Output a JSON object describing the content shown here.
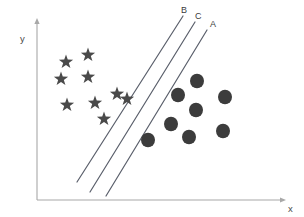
{
  "figure": {
    "title": "",
    "background_color": "#ffffff"
  },
  "axes": {
    "x_label": "x",
    "y_label": "y",
    "axis_color": "#a8a8a8",
    "origin": {
      "x": 37,
      "y": 200
    },
    "x_axis_end": {
      "x": 282,
      "y": 200
    },
    "y_axis_top": {
      "x": 37,
      "y": 22
    },
    "x_label_pos": {
      "x": 288,
      "y": 212
    },
    "y_label_pos": {
      "x": 20,
      "y": 42
    }
  },
  "chart_data": {
    "type": "scatter",
    "title": "",
    "xlabel": "x",
    "ylabel": "y",
    "grid": false,
    "legend": "none",
    "xlim": [
      0,
      304
    ],
    "ylim": [
      0,
      217
    ],
    "marker_colors": {
      "star": "#4a4a4a",
      "circle": "#3c3c3c",
      "boundary": "#5a5f6b"
    },
    "series": [
      {
        "name": "class-star",
        "marker": "star",
        "color": "#4a4a4a",
        "size": 7.5,
        "points": [
          {
            "x": 66,
            "y": 62
          },
          {
            "x": 88,
            "y": 55
          },
          {
            "x": 61,
            "y": 79
          },
          {
            "x": 88,
            "y": 77
          },
          {
            "x": 67,
            "y": 105
          },
          {
            "x": 95,
            "y": 103
          },
          {
            "x": 117,
            "y": 94
          },
          {
            "x": 127,
            "y": 99
          },
          {
            "x": 104,
            "y": 119
          }
        ]
      },
      {
        "name": "class-circle",
        "marker": "circle",
        "color": "#3c3c3c",
        "size": 7,
        "points": [
          {
            "x": 197,
            "y": 81
          },
          {
            "x": 178,
            "y": 95
          },
          {
            "x": 225,
            "y": 97
          },
          {
            "x": 196,
            "y": 110
          },
          {
            "x": 171,
            "y": 124
          },
          {
            "x": 223,
            "y": 131
          },
          {
            "x": 189,
            "y": 137
          },
          {
            "x": 148,
            "y": 140
          }
        ]
      }
    ],
    "boundaries": [
      {
        "label": "B",
        "name": "boundary-line-b",
        "x1": 183,
        "y1": 16,
        "x2": 77,
        "y2": 182,
        "label_pos": {
          "x": 181,
          "y": 13
        }
      },
      {
        "label": "C",
        "name": "boundary-line-c",
        "x1": 195,
        "y1": 22,
        "x2": 90,
        "y2": 192,
        "label_pos": {
          "x": 195,
          "y": 19
        }
      },
      {
        "label": "A",
        "name": "boundary-line-a",
        "x1": 207,
        "y1": 30,
        "x2": 106,
        "y2": 196,
        "label_pos": {
          "x": 210,
          "y": 27
        }
      }
    ],
    "annotations": [
      {
        "text": "B",
        "x": 181,
        "y": 13
      },
      {
        "text": "C",
        "x": 195,
        "y": 19
      },
      {
        "text": "A",
        "x": 210,
        "y": 27
      },
      {
        "text": "x",
        "x": 288,
        "y": 212
      },
      {
        "text": "y",
        "x": 20,
        "y": 42
      }
    ]
  }
}
